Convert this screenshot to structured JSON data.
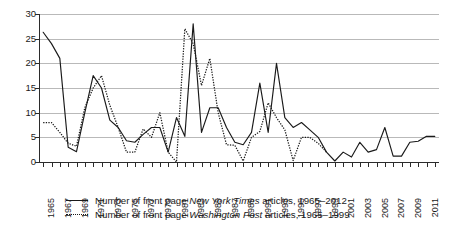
{
  "chart_data": {
    "type": "line",
    "title": "",
    "xlabel": "",
    "ylabel": "",
    "ylim": [
      0,
      30
    ],
    "xlim": [
      1965,
      2012
    ],
    "yticks": [
      0,
      5,
      10,
      15,
      20,
      25,
      30
    ],
    "grid": true,
    "legend_position": "below",
    "x": [
      1965,
      1966,
      1967,
      1968,
      1969,
      1970,
      1971,
      1972,
      1973,
      1974,
      1975,
      1976,
      1977,
      1978,
      1979,
      1980,
      1981,
      1982,
      1983,
      1984,
      1985,
      1986,
      1987,
      1988,
      1989,
      1990,
      1991,
      1992,
      1993,
      1994,
      1995,
      1996,
      1997,
      1998,
      1999,
      2000,
      2001,
      2002,
      2003,
      2004,
      2005,
      2006,
      2007,
      2008,
      2009,
      2010,
      2011,
      2012
    ],
    "xtick_labels": [
      "1965",
      "",
      "1967",
      "",
      "1969",
      "",
      "1971",
      "",
      "1973",
      "",
      "1975",
      "",
      "1977",
      "",
      "1979",
      "",
      "1981",
      "",
      "1983",
      "",
      "1985",
      "",
      "1987",
      "",
      "1989",
      "",
      "1991",
      "",
      "1993",
      "",
      "1995",
      "",
      "1997",
      "",
      "1999",
      "",
      "2001",
      "",
      "2003",
      "",
      "2005",
      "",
      "2007",
      "",
      "2009",
      "",
      "2011",
      ""
    ],
    "series": [
      {
        "name": "Number of front page New York Times articles, 1965-2012",
        "style": "solid",
        "color": "#1a1a1a",
        "values": [
          26.3,
          24,
          21,
          3,
          2.1,
          10,
          17.5,
          15,
          8.5,
          7,
          4.3,
          4,
          5.6,
          7,
          7,
          2,
          9,
          5.2,
          28,
          6,
          11,
          11,
          7,
          4,
          3.5,
          6,
          16,
          6,
          20,
          9,
          7,
          8,
          6.5,
          5,
          2,
          0.2,
          2,
          1,
          4,
          2,
          2.5,
          7,
          1.2,
          1.2,
          4,
          4.2,
          5.2,
          5.2
        ]
      },
      {
        "name": "Number of front page Washington Post articles, 1965-1999",
        "style": "dotted",
        "color": "#1a1a1a",
        "values": [
          8,
          8,
          6,
          3.8,
          3.2,
          11,
          15,
          17.5,
          11.5,
          7,
          2,
          2,
          6.7,
          5,
          10,
          2,
          0,
          27,
          24,
          15.5,
          21,
          10,
          3.5,
          3.4,
          0.2,
          5,
          6.2,
          12,
          9,
          6.5,
          0.3,
          5,
          5,
          3.8,
          2,
          null,
          null,
          null,
          null,
          null,
          null,
          null,
          null,
          null,
          null,
          null,
          null,
          null
        ]
      }
    ]
  },
  "legend": {
    "items": [
      {
        "swatch": "solid-line",
        "prefix": "Number of front page ",
        "emphasis": "New York Times",
        "suffix": " articles, 1965–2012"
      },
      {
        "swatch": "dotted-line",
        "prefix": "Number of front page ",
        "emphasis": "Washington Post",
        "suffix": " articles, 1965–1999"
      }
    ]
  }
}
